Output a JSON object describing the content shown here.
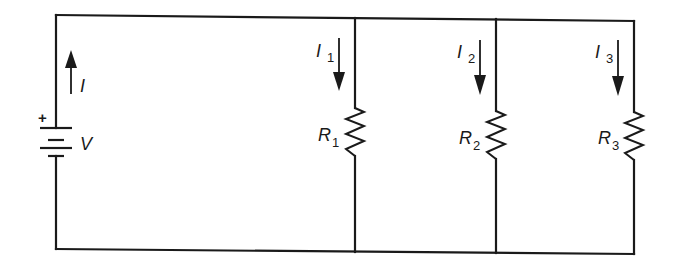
{
  "diagram": {
    "type": "parallel-resistor-circuit",
    "source": {
      "label": "V",
      "polarity_mark": "+",
      "current_label": "I",
      "current_direction": "up"
    },
    "branches": [
      {
        "resistor_label": "R",
        "resistor_sub": "1",
        "current_label": "I",
        "current_sub": "1",
        "current_direction": "down"
      },
      {
        "resistor_label": "R",
        "resistor_sub": "2",
        "current_label": "I",
        "current_sub": "2",
        "current_direction": "down"
      },
      {
        "resistor_label": "R",
        "resistor_sub": "3",
        "current_label": "I",
        "current_sub": "3",
        "current_direction": "down"
      }
    ],
    "colors": {
      "line": "#1a1a1a",
      "background": "#ffffff"
    }
  }
}
